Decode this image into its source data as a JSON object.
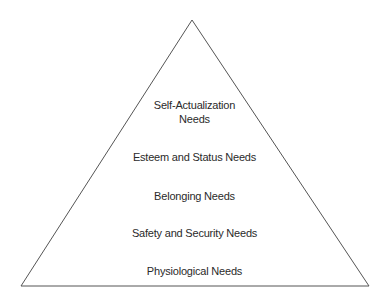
{
  "diagram": {
    "title": "",
    "shape": "pyramid",
    "stroke_color": "#555555",
    "levels": [
      {
        "line1": "Self-Actualization",
        "line2": "Needs"
      },
      {
        "line1": "Esteem and Status Needs"
      },
      {
        "line1": "Belonging Needs"
      },
      {
        "line1": "Safety and Security Needs"
      },
      {
        "line1": "Physiological Needs"
      }
    ]
  }
}
